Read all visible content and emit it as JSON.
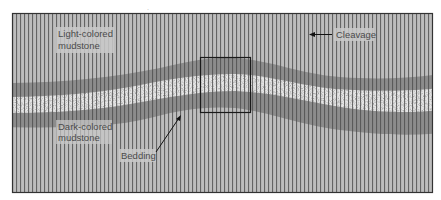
{
  "figure": {
    "kind": "geologic cross-section"
  },
  "labels": {
    "light_mudstone_line1": "Light-colored",
    "light_mudstone_line2": "mudstone",
    "dark_mudstone_line1": "Dark-colored",
    "dark_mudstone_line2": "mudstone",
    "cleavage": "Cleavage",
    "bedding": "Bedding"
  },
  "colors": {
    "light_mudstone": "#b9b9b9",
    "dark_mudstone": "#8a8a8a",
    "sandstone": "#e4e4e4",
    "cleavage_lines": "#555555",
    "frame": "#333333",
    "label_text": "#4a4a4a"
  },
  "icons": {
    "cleavage_arrow": "arrow-left",
    "bedding_arrow": "arrow-up-right"
  }
}
